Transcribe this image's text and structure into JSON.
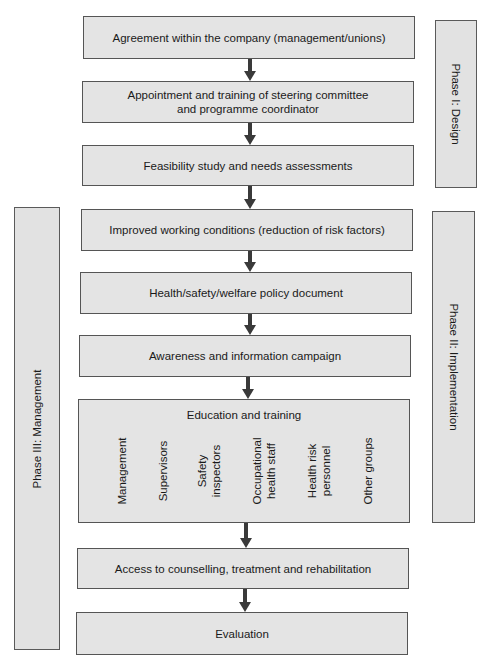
{
  "phases": {
    "design": "Phase I: Design",
    "implementation": "Phase II: Implementation",
    "management": "Phase III: Management"
  },
  "steps": [
    "Agreement within the company (management/unions)",
    "Appointment and training of steering committee and programme coordinator",
    "Feasibility study and needs assessments",
    "Improved working conditions (reduction of risk factors)",
    "Health/safety/welfare policy document",
    "Awareness and information campaign",
    "Education and training",
    "Access to counselling, treatment and rehabilitation",
    "Evaluation"
  ],
  "education_groups": [
    "Management",
    "Supervisors",
    "Safety inspectors",
    "Occupational health staff",
    "Health risk personnel",
    "Other groups"
  ],
  "colors": {
    "box_fill": "#e4e4e4",
    "border": "#555555",
    "arrow": "#3a3a3a"
  }
}
